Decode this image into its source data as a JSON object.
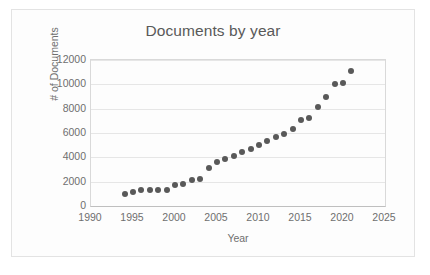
{
  "chart_data": {
    "type": "scatter",
    "title": "Documents by year",
    "xlabel": "Year",
    "ylabel": "# of Documents",
    "xlim": [
      1990,
      2025
    ],
    "ylim": [
      0,
      12000
    ],
    "xticks": [
      1990,
      1995,
      2000,
      2005,
      2010,
      2015,
      2020,
      2025
    ],
    "yticks": [
      0,
      2000,
      4000,
      6000,
      8000,
      10000,
      12000
    ],
    "grid": "horizontal",
    "legend": "none",
    "marker_color": "#595959",
    "gridline_color": "#e6e6e6",
    "text_color": "#6f6f6f",
    "x": [
      1994,
      1995,
      1996,
      1997,
      1998,
      1999,
      2000,
      2001,
      2002,
      2003,
      2004,
      2005,
      2006,
      2007,
      2008,
      2009,
      2010,
      2011,
      2012,
      2013,
      2014,
      2015,
      2016,
      2017,
      2018,
      2019,
      2020,
      2021
    ],
    "values": [
      1020,
      1120,
      1320,
      1340,
      1350,
      1330,
      1720,
      1780,
      2130,
      2200,
      3120,
      3580,
      3880,
      4130,
      4400,
      4650,
      5050,
      5330,
      5650,
      5890,
      6300,
      7050,
      7250,
      8150,
      8970,
      10050,
      10150,
      11120
    ],
    "series": [
      {
        "name": "Documents",
        "x": [
          1994,
          1995,
          1996,
          1997,
          1998,
          1999,
          2000,
          2001,
          2002,
          2003,
          2004,
          2005,
          2006,
          2007,
          2008,
          2009,
          2010,
          2011,
          2012,
          2013,
          2014,
          2015,
          2016,
          2017,
          2018,
          2019,
          2020,
          2021
        ],
        "values": [
          1020,
          1120,
          1320,
          1340,
          1350,
          1330,
          1720,
          1780,
          2130,
          2200,
          3120,
          3580,
          3880,
          4130,
          4400,
          4650,
          5050,
          5330,
          5650,
          5890,
          6300,
          7050,
          7250,
          8150,
          8970,
          10050,
          10150,
          11120
        ]
      }
    ]
  }
}
